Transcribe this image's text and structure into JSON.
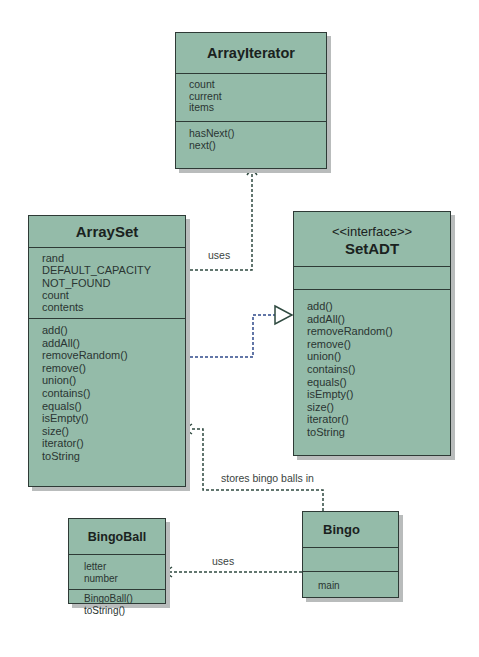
{
  "diagram": {
    "type": "UML class diagram",
    "classes": {
      "array_iterator": {
        "name": "ArrayIterator",
        "attributes": [
          "count",
          "current",
          "items"
        ],
        "methods": [
          "hasNext()",
          "next()"
        ]
      },
      "array_set": {
        "name": "ArraySet",
        "attributes": [
          "rand",
          "DEFAULT_CAPACITY",
          "NOT_FOUND",
          "count",
          "contents"
        ],
        "methods": [
          "add()",
          "addAll()",
          "removeRandom()",
          "remove()",
          "union()",
          "contains()",
          "equals()",
          "isEmpty()",
          "size()",
          "iterator()",
          "toString"
        ]
      },
      "set_adt": {
        "stereotype": "<<interface>>",
        "name": "SetADT",
        "attributes": [],
        "methods": [
          "add()",
          "addAll()",
          "removeRandom()",
          "remove()",
          "union()",
          "contains()",
          "equals()",
          "isEmpty()",
          "size()",
          "iterator()",
          "toString"
        ]
      },
      "bingo_ball": {
        "name": "BingoBall",
        "attributes": [
          "letter",
          "number"
        ],
        "methods": [
          "BingoBall()",
          "toString()"
        ]
      },
      "bingo": {
        "name": "Bingo",
        "attributes": [],
        "methods": [
          "main"
        ]
      }
    },
    "relationships": [
      {
        "from": "ArraySet",
        "to": "ArrayIterator",
        "kind": "dependency",
        "label": "uses"
      },
      {
        "from": "ArraySet",
        "to": "SetADT",
        "kind": "realization",
        "label": ""
      },
      {
        "from": "Bingo",
        "to": "ArraySet",
        "kind": "dependency",
        "label": "stores bingo balls in"
      },
      {
        "from": "Bingo",
        "to": "BingoBall",
        "kind": "dependency",
        "label": "uses"
      }
    ],
    "labels": {
      "uses_iterator": "uses",
      "stores": "stores bingo balls in",
      "uses_ball": "uses"
    },
    "colors": {
      "class_fill": "#94bba9",
      "class_border": "#2e3a36",
      "shadow": "#b9bcbc",
      "connector": "#3a5a4c",
      "realization_line": "#2f4a8a"
    }
  }
}
